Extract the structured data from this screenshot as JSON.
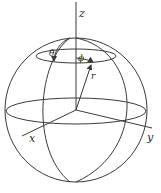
{
  "diagram": {
    "type": "spherical-coordinates",
    "labels": {
      "z_axis": "z",
      "x_axis": "x",
      "y_axis": "y",
      "theta": "θ",
      "phi": "ϕ",
      "radius": "r"
    },
    "colors": {
      "line": "#3a3a3a",
      "background": "#ffffff"
    }
  }
}
